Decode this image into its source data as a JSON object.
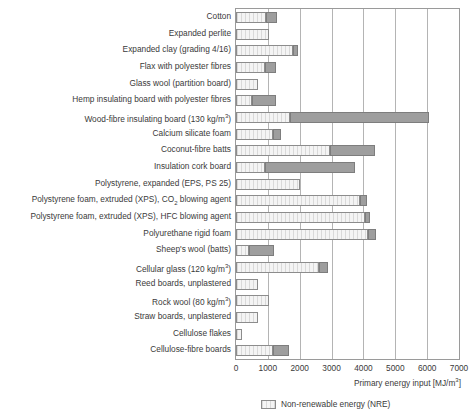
{
  "chart_data": {
    "type": "bar",
    "orientation": "horizontal",
    "stacked": true,
    "title": "",
    "xlabel": "Primary energy input [MJ/m3]",
    "xlabel_display": "Primary energy input [MJ/m³]",
    "ylabel": "",
    "xlim": [
      0,
      7000
    ],
    "xticks": [
      0,
      1000,
      2000,
      3000,
      4000,
      5000,
      6000,
      7000
    ],
    "xtick_labels": [
      "0",
      "1000",
      "2000",
      "3000",
      "4000",
      "5000",
      "6000",
      "7000"
    ],
    "grid": "vertical",
    "legend_position": "bottom-right",
    "legend": [
      {
        "name": "Non-renewable energy (NRE)",
        "color": "#eeeeee",
        "pattern": "vertical-hatch"
      }
    ],
    "series": [
      {
        "name": "Non-renewable energy (NRE)",
        "color": "#eeeeee"
      },
      {
        "name": "Remainder",
        "color": "#9e9e9e"
      }
    ],
    "categories": [
      "Cotton",
      "Expanded perlite",
      "Expanded clay (grading 4/16)",
      "Flax with polyester fibres",
      "Glass wool (partition board)",
      "Hemp insulating board with polyester fibres",
      "Wood-fibre insulating board (130 kg/m3)",
      "Calcium silicate foam",
      "Coconut-fibre batts",
      "Insulation cork board",
      "Polystyrene, expanded (EPS, PS 25)",
      "Polystyrene foam, extruded (XPS), CO2 blowing agent",
      "Polystyrene foam, extruded (XPS), HFC blowing agent",
      "Polyurethane rigid foam",
      "Sheep's wool (batts)",
      "Cellular glass (120 kg/m3)",
      "Reed boards, unplastered",
      "Rock wool (80 kg/m3)",
      "Straw boards, unplastered",
      "Cellulose flakes",
      "Cellulose-fibre boards"
    ],
    "bars": [
      {
        "label": "Cotton",
        "nre": 950,
        "total": 1300
      },
      {
        "label": "Expanded perlite",
        "nre": 1050,
        "total": 1050
      },
      {
        "label": "Expanded clay (grading 4/16)",
        "nre": 1800,
        "total": 1950
      },
      {
        "label": "Flax with polyester fibres",
        "nre": 900,
        "total": 1250
      },
      {
        "label": "Glass wool (partition board)",
        "nre": 700,
        "total": 700
      },
      {
        "label": "Hemp insulating board with polyester fibres",
        "nre": 500,
        "total": 1250
      },
      {
        "label": "Wood-fibre insulating board (130 kg/m3)",
        "nre": 1700,
        "total": 6050
      },
      {
        "label": "Calcium silicate foam",
        "nre": 1150,
        "total": 1400
      },
      {
        "label": "Coconut-fibre batts",
        "nre": 2950,
        "total": 4350
      },
      {
        "label": "Insulation cork board",
        "nre": 900,
        "total": 3750
      },
      {
        "label": "Polystyrene, expanded (EPS, PS 25)",
        "nre": 2000,
        "total": 2000
      },
      {
        "label": "Polystyrene foam, extruded (XPS), CO2 blowing agent",
        "nre": 3900,
        "total": 4100
      },
      {
        "label": "Polystyrene foam, extruded (XPS), HFC blowing agent",
        "nre": 4050,
        "total": 4200
      },
      {
        "label": "Polyurethane rigid foam",
        "nre": 4150,
        "total": 4400
      },
      {
        "label": "Sheep's wool (batts)",
        "nre": 400,
        "total": 1200
      },
      {
        "label": "Cellular glass (120 kg/m3)",
        "nre": 2600,
        "total": 2900
      },
      {
        "label": "Reed boards, unplastered",
        "nre": 700,
        "total": 700
      },
      {
        "label": "Rock wool (80 kg/m3)",
        "nre": 1050,
        "total": 1050
      },
      {
        "label": "Straw boards, unplastered",
        "nre": 700,
        "total": 700
      },
      {
        "label": "Cellulose flakes",
        "nre": 200,
        "total": 200
      },
      {
        "label": "Cellulose-fibre boards",
        "nre": 1150,
        "total": 1650
      }
    ]
  },
  "axis": {
    "title": "Primary energy input [MJ/m³]",
    "ticks": [
      "0",
      "1000",
      "2000",
      "3000",
      "4000",
      "5000",
      "6000",
      "7000"
    ]
  },
  "legend": {
    "nre_label": "Non-renewable energy (NRE)"
  },
  "labels": [
    "Cotton",
    "Expanded perlite",
    "Expanded clay (grading 4/16)",
    "Flax with polyester fibres",
    "Glass wool (partition board)",
    "Hemp insulating board with polyester fibres",
    "Wood-fibre insulating board (130 kg/m³)",
    "Calcium silicate foam",
    "Coconut-fibre batts",
    "Insulation cork board",
    "Polystyrene, expanded (EPS, PS 25)",
    "Polystyrene foam, extruded (XPS), CO₂ blowing agent",
    "Polystyrene foam, extruded (XPS), HFC blowing agent",
    "Polyurethane rigid foam",
    "Sheep's wool (batts)",
    "Cellular glass (120 kg/m³)",
    "Reed boards, unplastered",
    "Rock wool (80 kg/m³)",
    "Straw boards, unplastered",
    "Cellulose flakes",
    "Cellulose-fibre boards"
  ],
  "colors": {
    "nre_fill": "#eeeeee",
    "other_fill": "#9e9e9e",
    "grid": "#b4b4b4",
    "axis": "#9a9a9a",
    "text": "#3a3a3a"
  }
}
